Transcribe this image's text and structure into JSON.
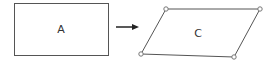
{
  "diagram": {
    "source_shape": {
      "label": "A",
      "type": "rectangle"
    },
    "transform_arrow": {
      "direction": "right"
    },
    "target_shape": {
      "label": "C",
      "type": "parallelogram",
      "vertex_markers": 4
    },
    "colors": {
      "stroke": "#555555",
      "vertex": "#777777",
      "background": "#ffffff"
    }
  }
}
